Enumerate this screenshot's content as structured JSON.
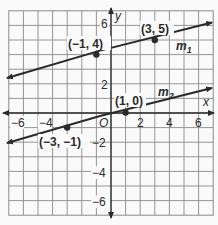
{
  "figure": {
    "type": "coordinate-plane",
    "x_range": [
      -7,
      7
    ],
    "y_range": [
      -7,
      7
    ],
    "axis_labels": {
      "x": "x",
      "y": "y",
      "origin": "O"
    },
    "x_ticks": [
      "−6",
      "−4",
      "2",
      "4",
      "6"
    ],
    "y_ticks": [
      "6",
      "2",
      "−2",
      "−4",
      "−6"
    ],
    "lines": [
      {
        "name": "m",
        "sub": "1",
        "points": [
          [
            -1,
            4
          ],
          [
            3,
            5
          ]
        ]
      },
      {
        "name": "m",
        "sub": "2",
        "points": [
          [
            -3,
            -1
          ],
          [
            1,
            0
          ]
        ]
      }
    ],
    "point_labels": {
      "p1": "(−1, 4)",
      "p2": "(3, 5)",
      "p3": "(1, 0)",
      "p4": "(−3, −1)"
    },
    "colors": {
      "grid": "#8a8a8a",
      "line": "#2a2a2a",
      "background": "#fafafa"
    }
  }
}
